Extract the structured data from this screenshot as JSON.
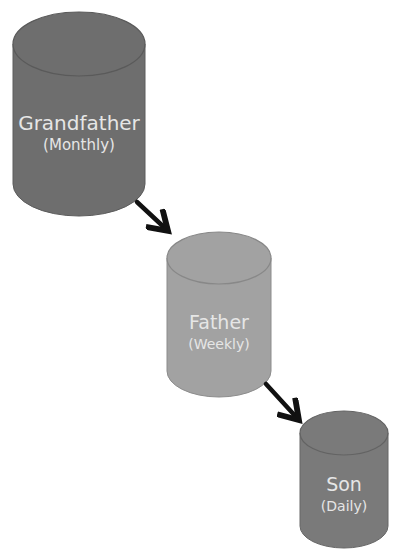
{
  "header_fragment": "· · ·   ·     ·  ·  ·   ·        ·          ·   ·  ·",
  "nodes": [
    {
      "id": "grandfather",
      "title": "Grandfather",
      "subtitle": "(Monthly)",
      "fill": "#6e6e6e"
    },
    {
      "id": "father",
      "title": "Father",
      "subtitle": "(Weekly)",
      "fill": "#a2a2a2"
    },
    {
      "id": "son",
      "title": "Son",
      "subtitle": "(Daily)",
      "fill": "#7a7a7a"
    }
  ],
  "edges": [
    {
      "from": "grandfather",
      "to": "father"
    },
    {
      "from": "father",
      "to": "son"
    }
  ],
  "colors": {
    "arrow": "#111111",
    "label_text": "#e6e6e6",
    "outline": "#5a5a5a"
  }
}
